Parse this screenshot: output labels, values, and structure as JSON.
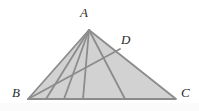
{
  "figure": {
    "canvas": {
      "width": 199,
      "height": 111
    },
    "background_color": "#ffffff",
    "fill_color": "#d2d2d2",
    "stroke_color": "#8c8c8c",
    "label_color": "#2b2b2b",
    "stroke_width": 1.8,
    "vertices": {
      "A": {
        "label": "A",
        "x": 89,
        "y": 30
      },
      "B": {
        "label": "B",
        "x": 28,
        "y": 99
      },
      "C": {
        "label": "C",
        "x": 176,
        "y": 99
      },
      "D": {
        "label": "D",
        "x": 120,
        "y": 49
      }
    },
    "triangle_path": "M 89 30 L 28 99 L 176 99 Z",
    "cevians": [
      {
        "name": "cevian-1",
        "from": "A",
        "to_x": 46,
        "to_y": 99
      },
      {
        "name": "cevian-2",
        "from": "A",
        "to_x": 64,
        "to_y": 99
      },
      {
        "name": "cevian-3",
        "from": "A",
        "to_x": 83,
        "to_y": 99
      },
      {
        "name": "cevian-4",
        "from": "A",
        "to_x": 125,
        "to_y": 99
      }
    ],
    "segments": [
      {
        "name": "segment-BD",
        "x1": 28,
        "y1": 99,
        "x2": 120,
        "y2": 49
      }
    ]
  }
}
